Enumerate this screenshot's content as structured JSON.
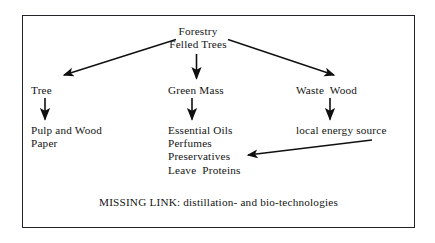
{
  "figure": {
    "title_node": "Forestry\nFelled Trees",
    "caption": "MISSING LINK: distillation- and bio-technologies",
    "border_color": "#23232a",
    "background_color": "#ffffff",
    "text_color": "#141414",
    "arrow_color": "#101010"
  },
  "nodes": {
    "root": "Forestry\nFelled Trees",
    "branch_left": "Tree",
    "branch_center": "Green Mass",
    "branch_right": "Waste  Wood",
    "leaf_left": "Pulp and Wood\nPaper",
    "leaf_center": "Essential Oils\nPerfumes\nPreservatives\nLeave  Proteins",
    "leaf_right": "local energy source"
  },
  "edges": [
    {
      "name": "forestry-to-tree",
      "from": "Forestry Felled Trees",
      "to": "Tree",
      "style": "diagonal-left"
    },
    {
      "name": "forestry-to-green-mass",
      "from": "Forestry Felled Trees",
      "to": "Green Mass",
      "style": "vertical"
    },
    {
      "name": "forestry-to-waste-wood",
      "from": "Forestry Felled Trees",
      "to": "Waste Wood",
      "style": "diagonal-right"
    },
    {
      "name": "tree-to-pulp",
      "from": "Tree",
      "to": "Pulp and Wood Paper",
      "style": "vertical"
    },
    {
      "name": "green-mass-to-oils",
      "from": "Green Mass",
      "to": "Essential Oils",
      "style": "vertical"
    },
    {
      "name": "waste-wood-to-energy",
      "from": "Waste Wood",
      "to": "local energy source",
      "style": "vertical"
    },
    {
      "name": "energy-to-oils",
      "from": "local energy source",
      "to": "Preservatives",
      "style": "diagonal-left-long"
    }
  ]
}
